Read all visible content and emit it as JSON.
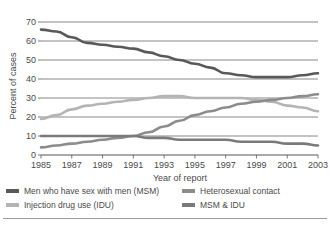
{
  "chart_data": {
    "type": "line",
    "title": "",
    "xlabel": "Year of report",
    "ylabel": "Percent of cases",
    "x": [
      1985,
      1986,
      1987,
      1988,
      1989,
      1990,
      1991,
      1992,
      1993,
      1994,
      1995,
      1996,
      1997,
      1998,
      1999,
      2000,
      2001,
      2002,
      2003
    ],
    "xticks": [
      "1985",
      "1987",
      "1989",
      "1991",
      "1993",
      "1995",
      "1997",
      "1999",
      "2001",
      "2003"
    ],
    "xtick_values": [
      1985,
      1987,
      1989,
      1991,
      1993,
      1995,
      1997,
      1999,
      2001,
      2003
    ],
    "yticks": [
      "0",
      "10",
      "20",
      "30",
      "40",
      "50",
      "60",
      "70"
    ],
    "ytick_values": [
      0,
      10,
      20,
      30,
      40,
      50,
      60,
      70
    ],
    "ylim": [
      0,
      70
    ],
    "xlim": [
      1985,
      2003
    ],
    "grid": "horizontal",
    "legend_position": "below",
    "series": [
      {
        "name": "Men who have sex with men (MSM)",
        "color": "#595959",
        "values": [
          66,
          65,
          62,
          59,
          58,
          57,
          56,
          54,
          52,
          50,
          48,
          46,
          43,
          42,
          41,
          41,
          41,
          42,
          43
        ]
      },
      {
        "name": "Injection drug use (IDU)",
        "color": "#b4b4b4",
        "values": [
          19,
          21,
          24,
          26,
          27,
          28,
          29,
          30,
          31,
          31,
          30,
          30,
          30,
          30,
          29,
          28,
          26,
          25,
          23
        ]
      },
      {
        "name": "Heterosexual contact",
        "color": "#8c8c8c",
        "values": [
          4,
          5,
          6,
          7,
          8,
          9,
          10,
          12,
          15,
          18,
          21,
          23,
          25,
          27,
          28,
          29,
          30,
          31,
          32
        ]
      },
      {
        "name": "MSM & IDU",
        "color": "#7a7a7a",
        "values": [
          10,
          10,
          10,
          10,
          10,
          10,
          10,
          9,
          9,
          8,
          8,
          8,
          8,
          7,
          7,
          7,
          6,
          6,
          5
        ]
      }
    ]
  },
  "axes": {
    "ylabel": "Percent of cases",
    "xlabel": "Year of report"
  },
  "legend": {
    "items": [
      {
        "label": "Men who have sex with men (MSM)",
        "color": "#595959"
      },
      {
        "label": "Heterosexual contact",
        "color": "#8c8c8c"
      },
      {
        "label": "Injection drug use (IDU)",
        "color": "#b4b4b4"
      },
      {
        "label": "MSM & IDU",
        "color": "#7a7a7a"
      }
    ]
  },
  "colors": {
    "axis": "#555555",
    "grid": "#6b6b6b",
    "text": "#4a4a4a",
    "background": "#ffffff",
    "rule": "#9a9a9a"
  }
}
